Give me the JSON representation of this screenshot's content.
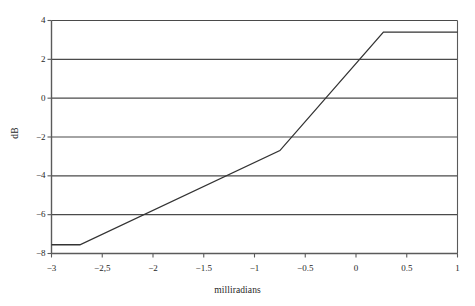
{
  "chart_data": {
    "type": "line",
    "title": "",
    "xlabel": "milliradians",
    "ylabel": "dB",
    "xlim": [
      -3,
      1
    ],
    "ylim": [
      -8,
      4
    ],
    "grid": "horizontal",
    "legend": "none",
    "xticks": [
      -3,
      -2.5,
      -2,
      -1.5,
      -1,
      -0.5,
      0,
      0.5,
      1
    ],
    "xtick_labels": [
      "-3",
      "-2,5",
      "-2",
      "-1.5",
      "-1",
      "-0.5",
      "0",
      "0.5",
      "1"
    ],
    "yticks": [
      -8,
      -6,
      -4,
      -2,
      0,
      2,
      4
    ],
    "ytick_labels": [
      "-8",
      "-6",
      "-4",
      "-2",
      "0",
      "2",
      "4"
    ],
    "series": [
      {
        "name": "response",
        "color": "#333333",
        "x": [
          -3.0,
          -2.72,
          -0.75,
          0.27,
          1.0
        ],
        "values": [
          -7.55,
          -7.55,
          -2.7,
          3.4,
          3.4
        ]
      }
    ]
  },
  "style": {
    "background": "#ffffff",
    "axis_color": "#5a5a5a",
    "grid_color": "#4a4a4a",
    "line_color": "#333333",
    "text_color": "#1f1f1f"
  }
}
